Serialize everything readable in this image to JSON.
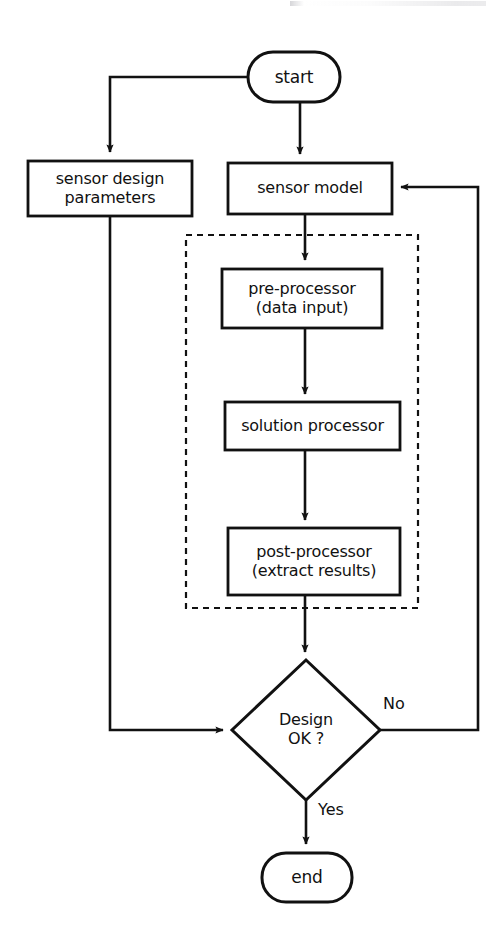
{
  "diagram": {
    "type": "flowchart",
    "title_fragment": "",
    "orientation": "top-to-bottom",
    "background_color": "#ffffff",
    "line_color": "#111111",
    "nodes": [
      {
        "id": "start",
        "shape": "stadium",
        "label": "start",
        "lines": [
          "start"
        ],
        "x": 248,
        "y": 52,
        "w": 92,
        "h": 50,
        "font_size": 17
      },
      {
        "id": "sensor-design-parameters",
        "shape": "rectangle",
        "label": "sensor design parameters",
        "lines": [
          "sensor design",
          "parameters"
        ],
        "x": 28,
        "y": 161,
        "w": 164,
        "h": 55,
        "font_size": 16
      },
      {
        "id": "sensor-model",
        "shape": "rectangle",
        "label": "sensor model",
        "lines": [
          "sensor model"
        ],
        "x": 228,
        "y": 163,
        "w": 164,
        "h": 51,
        "font_size": 16
      },
      {
        "id": "pre-processor",
        "shape": "rectangle",
        "label": "pre-processor (data input)",
        "lines": [
          "pre-processor",
          "(data input)"
        ],
        "x": 222,
        "y": 269,
        "w": 160,
        "h": 59,
        "font_size": 16
      },
      {
        "id": "solution-processor",
        "shape": "rectangle",
        "label": "solution processor",
        "lines": [
          "solution processor"
        ],
        "x": 225,
        "y": 402,
        "w": 175,
        "h": 48,
        "font_size": 16
      },
      {
        "id": "post-processor",
        "shape": "rectangle",
        "label": "post-processor (extract results)",
        "lines": [
          "post-processor",
          "(extract results)"
        ],
        "x": 228,
        "y": 528,
        "w": 172,
        "h": 67,
        "font_size": 16
      },
      {
        "id": "design-ok",
        "shape": "diamond",
        "label": "Design OK ?",
        "lines": [
          "Design",
          "OK ?"
        ],
        "cx": 306,
        "cy": 730,
        "rx": 74,
        "ry": 70,
        "font_size": 16
      },
      {
        "id": "end",
        "shape": "stadium",
        "label": "end",
        "lines": [
          "end"
        ],
        "x": 262,
        "y": 853,
        "w": 90,
        "h": 49,
        "font_size": 17
      }
    ],
    "group": {
      "id": "solver-group",
      "style": "dashed",
      "label": "",
      "x": 186,
      "y": 235,
      "w": 232,
      "h": 373
    },
    "edges": [
      {
        "id": "start-to-sensor-design",
        "from": "start",
        "to": "sensor-design-parameters",
        "label": "",
        "arrow": true
      },
      {
        "id": "start-to-sensor-model",
        "from": "start",
        "to": "sensor-model",
        "label": "",
        "arrow": true
      },
      {
        "id": "sensor-model-to-pre-processor",
        "from": "sensor-model",
        "to": "pre-processor",
        "label": "",
        "arrow": true
      },
      {
        "id": "pre-processor-to-solution-processor",
        "from": "pre-processor",
        "to": "solution-processor",
        "label": "",
        "arrow": true
      },
      {
        "id": "solution-processor-to-post-processor",
        "from": "solution-processor",
        "to": "post-processor",
        "label": "",
        "arrow": true
      },
      {
        "id": "post-processor-to-design-ok",
        "from": "post-processor",
        "to": "design-ok",
        "label": "",
        "arrow": true
      },
      {
        "id": "sensor-design-to-design-ok",
        "from": "sensor-design-parameters",
        "to": "design-ok",
        "label": "",
        "arrow": true
      },
      {
        "id": "design-ok-no-to-sensor-model",
        "from": "design-ok",
        "to": "sensor-model",
        "label": "No",
        "arrow": true
      },
      {
        "id": "design-ok-yes-to-end",
        "from": "design-ok",
        "to": "end",
        "label": "Yes",
        "arrow": true
      }
    ],
    "edge_labels": [
      {
        "id": "label-no",
        "text": "No",
        "x": 383,
        "y": 694
      },
      {
        "id": "label-yes",
        "text": "Yes",
        "x": 318,
        "y": 800
      }
    ]
  }
}
